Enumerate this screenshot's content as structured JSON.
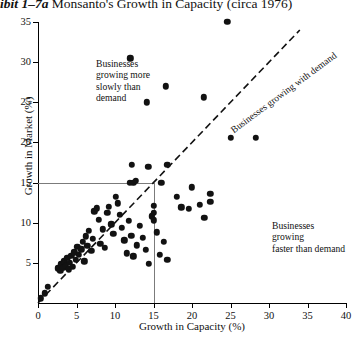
{
  "title": {
    "exhibit": "ibit 1–7a",
    "text": "Monsanto's Growth in Capacity (circa 1976)"
  },
  "chart_data": {
    "type": "scatter",
    "title": "Monsanto's Growth in Capacity (circa 1976)",
    "xlabel": "Growth in Capacity (%)",
    "ylabel": "Growth in Market (%)",
    "xlim": [
      0,
      40
    ],
    "ylim": [
      0,
      35
    ],
    "xticks": [
      0,
      5,
      10,
      15,
      20,
      25,
      30,
      35,
      40
    ],
    "yticks": [
      0,
      5,
      10,
      15,
      20,
      25,
      30,
      35
    ],
    "grid": false,
    "legend": "none",
    "reference_lines": {
      "horizontal_y": 15,
      "vertical_x": 15,
      "parity": {
        "label": "Businesses growing with demand",
        "style": "dashed",
        "from": [
          0,
          0
        ],
        "to": [
          34,
          34
        ]
      }
    },
    "annotations": [
      {
        "id": "slower-than-demand",
        "text": "Businesses\ngrowing more\nslowly than\ndemand",
        "region": "above-parity-line"
      },
      {
        "id": "faster-than-demand",
        "text": "Businesses growing\nfaster than demand",
        "region": "below-parity-line"
      }
    ],
    "points": [
      [
        0.4,
        0.6
      ],
      [
        0.9,
        1.2
      ],
      [
        1.3,
        2.0
      ],
      [
        2.6,
        4.3
      ],
      [
        2.9,
        4.0
      ],
      [
        3.0,
        4.8
      ],
      [
        3.3,
        4.4
      ],
      [
        3.4,
        5.2
      ],
      [
        3.6,
        4.6
      ],
      [
        3.8,
        5.6
      ],
      [
        4.0,
        4.2
      ],
      [
        4.1,
        5.0
      ],
      [
        4.3,
        5.9
      ],
      [
        4.5,
        4.5
      ],
      [
        4.7,
        6.3
      ],
      [
        4.9,
        5.4
      ],
      [
        5.1,
        7.0
      ],
      [
        5.3,
        6.0
      ],
      [
        5.6,
        6.7
      ],
      [
        5.8,
        7.6
      ],
      [
        6.0,
        5.2
      ],
      [
        6.2,
        8.3
      ],
      [
        6.4,
        7.1
      ],
      [
        6.6,
        9.0
      ],
      [
        6.9,
        6.5
      ],
      [
        7.1,
        8.0
      ],
      [
        7.3,
        11.4
      ],
      [
        7.6,
        11.8
      ],
      [
        7.9,
        10.4
      ],
      [
        8.1,
        7.4
      ],
      [
        8.4,
        9.2
      ],
      [
        8.7,
        6.9
      ],
      [
        9.0,
        11.2
      ],
      [
        9.2,
        12.0
      ],
      [
        9.5,
        9.8
      ],
      [
        9.8,
        8.6
      ],
      [
        10.1,
        13.2
      ],
      [
        10.4,
        12.4
      ],
      [
        10.6,
        11.0
      ],
      [
        10.9,
        9.4
      ],
      [
        11.2,
        7.8
      ],
      [
        11.5,
        6.2
      ],
      [
        11.8,
        10.2
      ],
      [
        12.1,
        8.4
      ],
      [
        12.4,
        5.8
      ],
      [
        12.8,
        7.2
      ],
      [
        13.2,
        9.6
      ],
      [
        13.6,
        8.1
      ],
      [
        14.0,
        6.6
      ],
      [
        14.4,
        4.9
      ],
      [
        14.8,
        10.8
      ],
      [
        15.0,
        12.1
      ],
      [
        15.0,
        11.2
      ],
      [
        15.0,
        10.3
      ],
      [
        15.4,
        8.8
      ],
      [
        15.8,
        6.0
      ],
      [
        16.3,
        7.6
      ],
      [
        16.8,
        5.4
      ],
      [
        11.9,
        15.0
      ],
      [
        12.4,
        15.0
      ],
      [
        12.7,
        15.2
      ],
      [
        16.0,
        15.0
      ],
      [
        12.2,
        17.2
      ],
      [
        14.3,
        17.0
      ],
      [
        16.8,
        17.2
      ],
      [
        18.0,
        13.2
      ],
      [
        18.6,
        11.9
      ],
      [
        19.6,
        11.7
      ],
      [
        20.0,
        14.4
      ],
      [
        21.0,
        12.2
      ],
      [
        21.6,
        10.6
      ],
      [
        22.4,
        13.6
      ],
      [
        22.4,
        12.6
      ],
      [
        12.0,
        30.5
      ],
      [
        16.6,
        27.0
      ],
      [
        14.1,
        25.0
      ],
      [
        21.5,
        25.6
      ],
      [
        24.6,
        35.0
      ],
      [
        25.0,
        20.6
      ],
      [
        28.3,
        20.6
      ]
    ]
  }
}
